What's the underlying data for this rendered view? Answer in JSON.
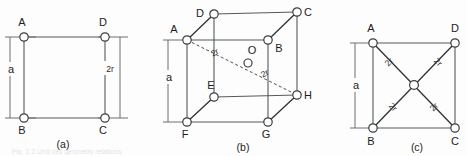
{
  "figure": {
    "background_color": "#fdfdfd",
    "line_color": "#555a5e",
    "atom_fill": "#ffffff",
    "atom_stroke": "#3a3e41",
    "cut_off_caption": "Fig. 1.2  Unit cell geometry relations"
  },
  "panels": [
    {
      "id": "a",
      "caption": "(a)",
      "type": "simple-cubic-face",
      "vertices": [
        {
          "name": "A",
          "label": "A",
          "x": 24,
          "y": 37,
          "label_x": 22,
          "label_y": 26
        },
        {
          "name": "D",
          "label": "D",
          "x": 105,
          "y": 37,
          "label_x": 103,
          "label_y": 26
        },
        {
          "name": "B",
          "label": "B",
          "x": 24,
          "y": 118,
          "label_x": 22,
          "label_y": 134
        },
        {
          "name": "C",
          "label": "C",
          "x": 105,
          "y": 118,
          "label_x": 103,
          "label_y": 134
        }
      ],
      "dimensions": [
        {
          "name": "a",
          "label": "a",
          "label_x": 11,
          "label_y": 70,
          "x": 10,
          "y1": 37,
          "y2": 118
        },
        {
          "name": "2r",
          "label": "2r",
          "label_x": 107,
          "label_y": 72,
          "x": 120,
          "y1": 37,
          "y2": 118
        }
      ]
    },
    {
      "id": "b",
      "caption": "(b)",
      "type": "body-centered-cubic",
      "vertices": [
        {
          "name": "D",
          "label": "D",
          "x": 214,
          "y": 14,
          "label_x": 200,
          "label_y": 13
        },
        {
          "name": "C",
          "label": "C",
          "x": 297,
          "y": 12,
          "label_x": 307,
          "label_y": 13
        },
        {
          "name": "A",
          "label": "A",
          "x": 187,
          "y": 40,
          "label_x": 173,
          "label_y": 34
        },
        {
          "name": "B",
          "label": "B",
          "x": 268,
          "y": 40,
          "label_x": 276,
          "label_y": 50
        },
        {
          "name": "E",
          "label": "E",
          "x": 214,
          "y": 97,
          "label_x": 209,
          "label_y": 86
        },
        {
          "name": "H",
          "label": "H",
          "x": 297,
          "y": 95,
          "label_x": 305,
          "label_y": 101
        },
        {
          "name": "F",
          "label": "F",
          "x": 187,
          "y": 122,
          "label_x": 183,
          "label_y": 137
        },
        {
          "name": "G",
          "label": "G",
          "x": 268,
          "y": 122,
          "label_x": 264,
          "label_y": 137
        },
        {
          "name": "O",
          "label": "O",
          "x": 248,
          "y": 63,
          "label_x": 251,
          "label_y": 55
        }
      ],
      "dimensions": [
        {
          "name": "a",
          "label": "a",
          "label_x": 172,
          "label_y": 80,
          "x": 168,
          "y1": 40,
          "y2": 122
        },
        {
          "name": "2r-upper",
          "label": "2r",
          "label_x": 216,
          "label_y": 53
        },
        {
          "name": "2r-lower",
          "label": "2r",
          "label_x": 264,
          "label_y": 75
        }
      ]
    },
    {
      "id": "c",
      "caption": "(c)",
      "type": "face-centered-cubic-face",
      "vertices": [
        {
          "name": "A",
          "label": "A",
          "x": 373,
          "y": 43,
          "label_x": 370,
          "label_y": 32
        },
        {
          "name": "D",
          "label": "D",
          "x": 455,
          "y": 43,
          "label_x": 452,
          "label_y": 32
        },
        {
          "name": "B",
          "label": "B",
          "x": 373,
          "y": 128,
          "label_x": 370,
          "label_y": 144
        },
        {
          "name": "C",
          "label": "C",
          "x": 455,
          "y": 128,
          "label_x": 452,
          "label_y": 144
        },
        {
          "name": "center",
          "label": "",
          "x": 414,
          "y": 85,
          "label_x": 0,
          "label_y": 0
        }
      ],
      "dimensions": [
        {
          "name": "a",
          "label": "a",
          "label_x": 358,
          "label_y": 88,
          "x": 355,
          "y1": 43,
          "y2": 128
        },
        {
          "name": "2r-top-left",
          "label": "2r",
          "label_x": 388,
          "label_y": 62
        },
        {
          "name": "2r-top-right",
          "label": "2r",
          "label_x": 433,
          "label_y": 62
        },
        {
          "name": "2r-bottom-left",
          "label": "2r",
          "label_x": 388,
          "label_y": 106
        },
        {
          "name": "2r-bottom-right",
          "label": "2r",
          "label_x": 433,
          "label_y": 106
        }
      ]
    }
  ],
  "captions": {
    "a": {
      "text": "(a)",
      "x": 63,
      "y": 147
    },
    "b": {
      "text": "(b)",
      "x": 243,
      "y": 150
    },
    "c": {
      "text": "(c)",
      "x": 417,
      "y": 150
    }
  }
}
